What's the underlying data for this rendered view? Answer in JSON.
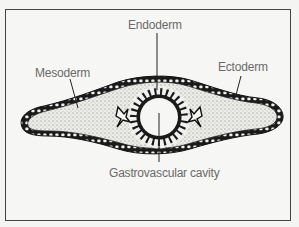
{
  "figure": {
    "type": "cross-section diagram",
    "colors": {
      "frame": "#444444",
      "background": "#f6f6f4",
      "label_text": "#6a6a6a",
      "outline": "#1a1a1a",
      "mesoderm_fill": "#dcdcd8"
    },
    "labels": {
      "endoderm": "Endoderm",
      "mesoderm": "Mesoderm",
      "ectoderm": "Ectoderm",
      "gastrovascular_cavity": "Gastrovascular cavity"
    }
  }
}
